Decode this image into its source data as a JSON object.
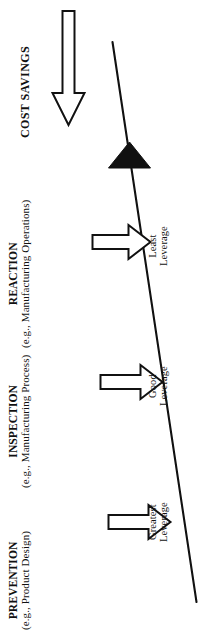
{
  "diagram": {
    "title_text": "COST SAVINGS",
    "orientation": "rotated-90-ccw",
    "line_color": "#111111",
    "text_color": "#111111",
    "background": "#ffffff",
    "categories": [
      {
        "id": "prevention",
        "label": "PREVENTION",
        "example": "(e.g., Product Design)",
        "leverage": "Greatest",
        "leverage_word": "Leverage",
        "arrow": "down-arrow"
      },
      {
        "id": "inspection",
        "label": "INSPECTION",
        "example": "(e.g., Manufacturing Process)",
        "leverage": "Good",
        "leverage_word": "Leverage",
        "arrow": "down-arrow"
      },
      {
        "id": "reaction",
        "label": "REACTION",
        "example": "(e.g., Manufacturing Operations)",
        "leverage": "Least",
        "leverage_word": "Leverage",
        "arrow": "down-arrow"
      }
    ],
    "cost_savings": {
      "label": "COST SAVINGS",
      "arrow": "left-pointing-block-arrow",
      "marker": "solid-black-triangle"
    }
  }
}
